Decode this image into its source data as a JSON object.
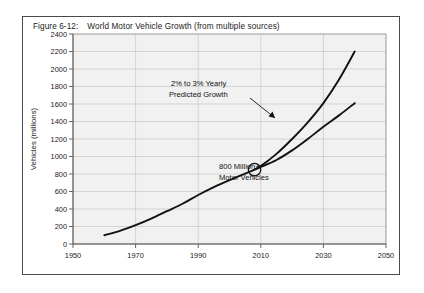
{
  "figure": {
    "number": "Figure 6-12:",
    "caption": "World Motor Vehicle Growth (from multiple sources)"
  },
  "chart_data": {
    "type": "line",
    "title": "World Motor Vehicle Growth (from multiple sources)",
    "xlabel": "",
    "ylabel": "Vehicles (millions)",
    "xlim": [
      1950,
      2050
    ],
    "ylim": [
      0,
      2400
    ],
    "xticks": [
      1950,
      1970,
      1990,
      2010,
      2030,
      2050
    ],
    "yticks": [
      0,
      200,
      400,
      600,
      800,
      1000,
      1200,
      1400,
      1600,
      1800,
      2000,
      2200,
      2400
    ],
    "grid": true,
    "legend": "none",
    "series": [
      {
        "name": "Historical and 3% Yearly Predicted Growth",
        "x": [
          1960,
          1965,
          1970,
          1975,
          1980,
          1985,
          1990,
          1995,
          2000,
          2005,
          2008,
          2010,
          2015,
          2020,
          2025,
          2030,
          2035,
          2040
        ],
        "values": [
          100,
          150,
          215,
          290,
          375,
          460,
          560,
          650,
          730,
          805,
          850,
          890,
          1030,
          1200,
          1390,
          1610,
          1880,
          2200
        ]
      },
      {
        "name": "2% Yearly Predicted Growth",
        "x": [
          2008,
          2010,
          2015,
          2020,
          2025,
          2030,
          2035,
          2040
        ],
        "values": [
          850,
          880,
          960,
          1070,
          1200,
          1340,
          1470,
          1610
        ]
      }
    ],
    "annotations": [
      {
        "name": "growth-rate-annotation",
        "line1": "2% to 3% Yearly",
        "line2": "Predicted Growth",
        "arrow": true
      },
      {
        "name": "milestone-annotation",
        "line1": "800 Million+",
        "line2": "Motor Vehicles",
        "marker": "circle",
        "marker_x": 2008,
        "marker_y": 850
      }
    ]
  },
  "colors": {
    "curve": "#111111",
    "plot_background": "#f1f1f1",
    "gridline": "#bfbfbf",
    "frame": "#4a4a4a"
  }
}
